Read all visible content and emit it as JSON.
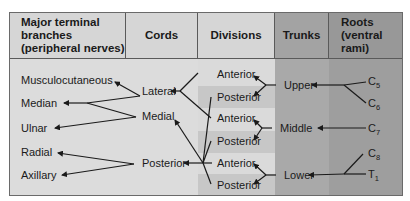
{
  "headers": {
    "branches": "Major terminal branches (peripheral nerves)",
    "branches_l1": "Major terminal",
    "branches_l2": "branches",
    "branches_l3": "(peripheral nerves)",
    "cords": "Cords",
    "divisions": "Divisions",
    "trunks": "Trunks",
    "roots_l1": "Roots",
    "roots_l2": "(ventral",
    "roots_l3": "rami)"
  },
  "branches": [
    "Musculocutaneous",
    "Median",
    "Ulnar",
    "Radial",
    "Axillary"
  ],
  "cords": [
    "Lateral",
    "Medial",
    "Posterior"
  ],
  "divisions": [
    "Anterior",
    "Posterior",
    "Anterior",
    "Posterior",
    "Anterior",
    "Posterior"
  ],
  "trunks": [
    "Upper",
    "Middle",
    "Lower"
  ],
  "roots": [
    {
      "letter": "C",
      "num": "5"
    },
    {
      "letter": "C",
      "num": "6"
    },
    {
      "letter": "C",
      "num": "7"
    },
    {
      "letter": "C",
      "num": "8"
    },
    {
      "letter": "T",
      "num": "1"
    }
  ],
  "colors": {
    "branches_bg": "#dcdcdc",
    "cords_bg": "#dcdcdc",
    "divisions_bg": "#d9d9d9",
    "division_band": "#c7c7c7",
    "trunks_bg": "#a9a9a9",
    "roots_bg": "#9d9d9d"
  }
}
